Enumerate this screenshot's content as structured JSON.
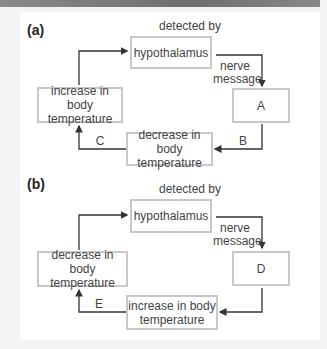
{
  "diagram_a": {
    "label": "(a)",
    "detected_by": "detected by",
    "hypothalamus": "hypothalamus",
    "nerve": "nerve",
    "message": "message",
    "box_A": "A",
    "increase_line1": "increase in body",
    "increase_line2": "temperature",
    "decrease_line1": "decrease in body",
    "decrease_line2": "temperature",
    "label_B": "B",
    "label_C": "C"
  },
  "diagram_b": {
    "label": "(b)",
    "detected_by": "detected by",
    "hypothalamus": "hypothalamus",
    "nerve": "nerve",
    "message": "message",
    "box_D": "D",
    "decrease_line1": "decrease in body",
    "decrease_line2": "temperature",
    "increase_line1": "increase in body",
    "increase_line2": "temperature",
    "label_E": "E"
  },
  "colors": {
    "box_border": "#c8c8c8",
    "arrow": "#333333",
    "top_strip": "#7a7a7a"
  }
}
